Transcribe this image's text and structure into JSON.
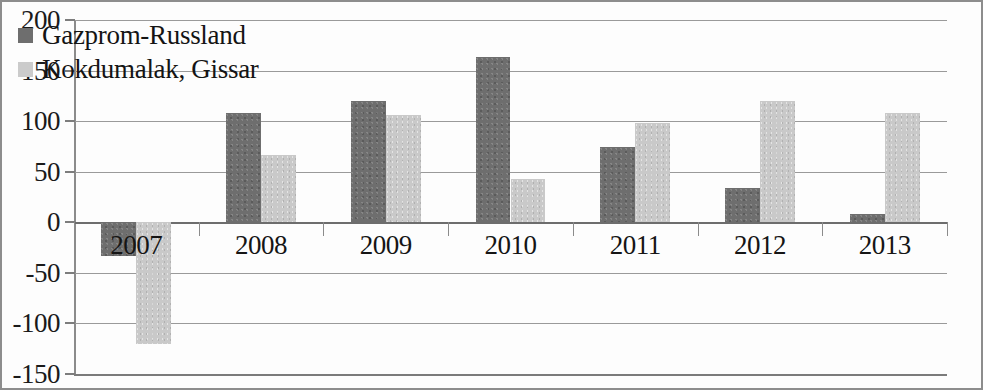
{
  "chart_data": {
    "type": "bar",
    "title": "",
    "subtitle": "",
    "xlabel": "",
    "ylabel": "",
    "categories": [
      "2007",
      "2008",
      "2009",
      "2010",
      "2011",
      "2012",
      "2013"
    ],
    "series": [
      {
        "name": "Gazprom-Russland",
        "color": "#6e6e6e",
        "values": [
          -33,
          108,
          120,
          163,
          74,
          34,
          8
        ]
      },
      {
        "name": "Kokdumalak, Gissar",
        "color": "#c9c9c9",
        "values": [
          -120,
          67,
          106,
          43,
          98,
          120,
          108
        ]
      }
    ],
    "ylim": [
      -150,
      200
    ],
    "yticks": [
      200,
      150,
      100,
      50,
      0,
      -50,
      -100,
      -150
    ],
    "ytick_labels": [
      "200",
      "150",
      "100",
      "50",
      "0",
      "-50",
      "-100",
      "-150"
    ],
    "grid": true,
    "grid_axis": "y",
    "legend_position": "top-left-inside",
    "annotations": []
  },
  "legend": {
    "items": [
      {
        "label": "Gazprom-Russland",
        "swatch": "#6e6e6e"
      },
      {
        "label": "Kokdumalak, Gissar",
        "swatch": "#cbcbcb"
      }
    ]
  }
}
